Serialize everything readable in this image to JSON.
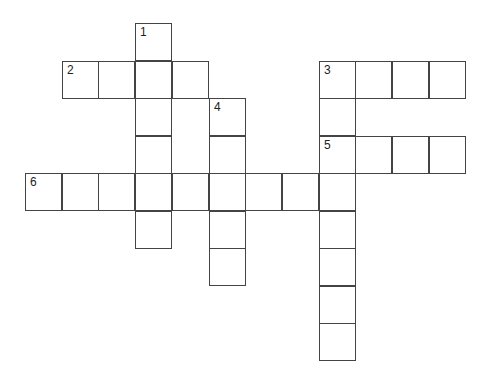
{
  "puzzle": {
    "type": "crossword",
    "origin": {
      "x": 26,
      "y": 24
    },
    "cell_w": 36.7,
    "cell_h": 37.5,
    "colors": {
      "border": "#444444",
      "background": "#ffffff",
      "number": "#222222"
    },
    "cells": [
      {
        "r": 0,
        "c": 3,
        "n": "1"
      },
      {
        "r": 1,
        "c": 1,
        "n": "2"
      },
      {
        "r": 1,
        "c": 2
      },
      {
        "r": 1,
        "c": 3
      },
      {
        "r": 1,
        "c": 4
      },
      {
        "r": 1,
        "c": 8,
        "n": "3"
      },
      {
        "r": 1,
        "c": 9
      },
      {
        "r": 1,
        "c": 10
      },
      {
        "r": 1,
        "c": 11
      },
      {
        "r": 2,
        "c": 3
      },
      {
        "r": 2,
        "c": 5,
        "n": "4"
      },
      {
        "r": 2,
        "c": 8
      },
      {
        "r": 3,
        "c": 3
      },
      {
        "r": 3,
        "c": 5
      },
      {
        "r": 3,
        "c": 8,
        "n": "5"
      },
      {
        "r": 3,
        "c": 9
      },
      {
        "r": 3,
        "c": 10
      },
      {
        "r": 3,
        "c": 11
      },
      {
        "r": 4,
        "c": 0,
        "n": "6"
      },
      {
        "r": 4,
        "c": 1
      },
      {
        "r": 4,
        "c": 2
      },
      {
        "r": 4,
        "c": 3
      },
      {
        "r": 4,
        "c": 4
      },
      {
        "r": 4,
        "c": 5
      },
      {
        "r": 4,
        "c": 6
      },
      {
        "r": 4,
        "c": 7
      },
      {
        "r": 4,
        "c": 8
      },
      {
        "r": 5,
        "c": 3
      },
      {
        "r": 5,
        "c": 5
      },
      {
        "r": 5,
        "c": 8
      },
      {
        "r": 6,
        "c": 5
      },
      {
        "r": 6,
        "c": 8
      },
      {
        "r": 7,
        "c": 8
      },
      {
        "r": 8,
        "c": 8
      }
    ],
    "entries": [
      {
        "number": "1",
        "direction": "down",
        "length": 6
      },
      {
        "number": "2",
        "direction": "across",
        "length": 4
      },
      {
        "number": "3",
        "direction": "across",
        "length": 4
      },
      {
        "number": "3",
        "direction": "down",
        "length": 8
      },
      {
        "number": "4",
        "direction": "down",
        "length": 5
      },
      {
        "number": "5",
        "direction": "across",
        "length": 4
      },
      {
        "number": "6",
        "direction": "across",
        "length": 9
      }
    ]
  }
}
